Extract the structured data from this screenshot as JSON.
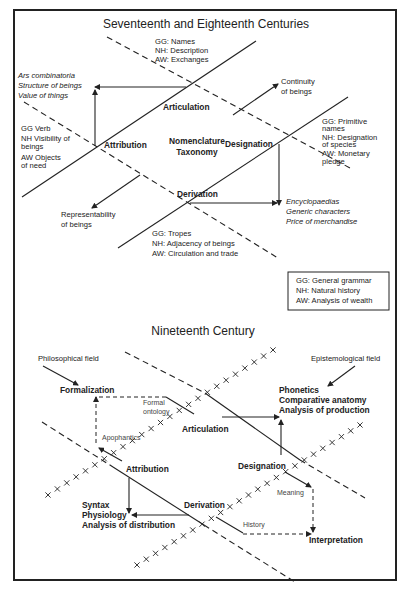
{
  "top": {
    "title": "Seventeenth and Eighteenth Centuries",
    "articulation": {
      "label": "Articulation",
      "gg": "GG: Names",
      "nh": "NH: Description",
      "aw": "AW: Exchanges"
    },
    "attribution": {
      "label": "Attribution",
      "gg": "GG Verb",
      "nh1": "NH Visibility of",
      "nh2": "beings",
      "aw1": "AW Objects",
      "aw2": "of need"
    },
    "designation": {
      "label": "Designation",
      "gg1": "GG: Primitive",
      "gg2": "names",
      "nh1": "NH: Designation",
      "nh2": "of species",
      "aw1": "AW: Monetary",
      "aw2": "pledge"
    },
    "derivation": {
      "label": "Derivation",
      "gg": "GG: Tropes",
      "nh": "NH: Adjacency of beings",
      "aw": "AW: Circulation and trade"
    },
    "center1": "Nomenclature",
    "center2": "Taxonomy",
    "ars": [
      "Ars combinatoria",
      "Structure of beings",
      "Value of things"
    ],
    "encyclo": [
      "Encyclopaedias",
      "Generic characters",
      "Price of  merchandise"
    ],
    "continuity": [
      "Continuity",
      "of beings"
    ],
    "representability": [
      "Representability",
      "of beings"
    ],
    "legend": [
      "GG: General grammar",
      "NH: Natural history",
      "AW: Analysis of wealth"
    ]
  },
  "bottom": {
    "title": "Nineteenth Century",
    "philosophical_field": "Philosophical field",
    "epistemological_field": "Epistemological field",
    "formalization": "Formalization",
    "formal_ontology": [
      "Formal",
      "ontology"
    ],
    "apophantics": "Apophantics",
    "articulation": "Articulation",
    "attribution": "Attribution",
    "designation": "Designation",
    "derivation": "Derivation",
    "phonetics": [
      "Phonetics",
      "Comparative  anatomy",
      "Analysis of production"
    ],
    "syntax": [
      "Syntax",
      "Physiology",
      "Analysis of distribution"
    ],
    "meaning": "Meaning",
    "history": "History",
    "interpretation": "Interpretation"
  }
}
